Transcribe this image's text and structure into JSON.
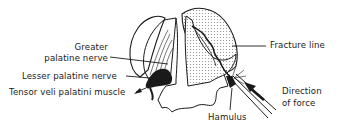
{
  "diagram": {
    "type": "anatomical-illustration",
    "labels": {
      "greater_palatine_nerve_line1": "Greater",
      "greater_palatine_nerve_line2": "palatine nerve",
      "lesser_palatine_nerve": "Lesser palatine nerve",
      "tensor_veli_palatini_muscle": "Tensor veli palatini muscle",
      "fracture_line": "Fracture line",
      "hamulus": "Hamulus",
      "direction_of_force_line1": "Direction",
      "direction_of_force_line2": "of force"
    },
    "colors": {
      "ink": "#1a1a1a",
      "stipple": "#d8d8d8",
      "background": "#ffffff"
    }
  }
}
